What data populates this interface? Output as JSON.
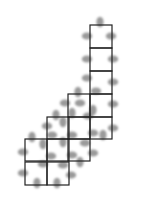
{
  "diagram": {
    "width": 147,
    "height": 206,
    "colors": {
      "line": "#222222",
      "blob": "#9a9a9a",
      "background": "#ffffff"
    },
    "cell_size": 22,
    "cells": [
      [
        90,
        25
      ],
      [
        90,
        48
      ],
      [
        90,
        71
      ],
      [
        90,
        94
      ],
      [
        90,
        117
      ],
      [
        68,
        94
      ],
      [
        68,
        117
      ],
      [
        47,
        117
      ],
      [
        25,
        139
      ],
      [
        47,
        139
      ],
      [
        68,
        139
      ],
      [
        25,
        162
      ],
      [
        47,
        162
      ]
    ],
    "blobs": [
      [
        100,
        22,
        "v"
      ],
      [
        87,
        36,
        "h"
      ],
      [
        111,
        36,
        "h"
      ],
      [
        87,
        59,
        "h"
      ],
      [
        113,
        59,
        "h"
      ],
      [
        87,
        78,
        "h"
      ],
      [
        113,
        82,
        "h"
      ],
      [
        78,
        92,
        "v"
      ],
      [
        96,
        91,
        "h"
      ],
      [
        65,
        103,
        "h"
      ],
      [
        80,
        103,
        "h"
      ],
      [
        93,
        110,
        "v"
      ],
      [
        113,
        104,
        "h"
      ],
      [
        56,
        115,
        "v"
      ],
      [
        72,
        113,
        "v"
      ],
      [
        88,
        116,
        "h"
      ],
      [
        47,
        126,
        "h"
      ],
      [
        63,
        122,
        "v"
      ],
      [
        113,
        128,
        "h"
      ],
      [
        32,
        137,
        "v"
      ],
      [
        52,
        135,
        "h"
      ],
      [
        72,
        135,
        "h"
      ],
      [
        93,
        133,
        "h"
      ],
      [
        103,
        135,
        "v"
      ],
      [
        43,
        144,
        "v"
      ],
      [
        63,
        142,
        "v"
      ],
      [
        85,
        143,
        "h"
      ],
      [
        23,
        152,
        "h"
      ],
      [
        51,
        156,
        "h"
      ],
      [
        72,
        155,
        "h"
      ],
      [
        93,
        153,
        "h"
      ],
      [
        43,
        164,
        "h"
      ],
      [
        63,
        165,
        "h"
      ],
      [
        80,
        162,
        "v"
      ],
      [
        23,
        173,
        "h"
      ],
      [
        71,
        175,
        "h"
      ],
      [
        37,
        183,
        "v"
      ],
      [
        57,
        183,
        "v"
      ]
    ]
  }
}
